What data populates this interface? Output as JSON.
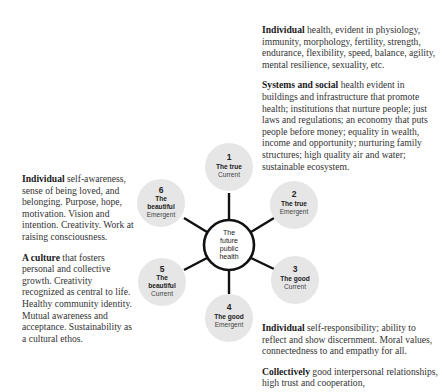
{
  "diagram": {
    "center": {
      "lines": [
        "The",
        "future",
        "public",
        "health"
      ]
    },
    "nodes": [
      {
        "number": "1",
        "title": [
          "The true"
        ],
        "subtitle": "Current"
      },
      {
        "number": "2",
        "title": [
          "The true"
        ],
        "subtitle": "Emergent"
      },
      {
        "number": "3",
        "title": [
          "The good"
        ],
        "subtitle": "Current"
      },
      {
        "number": "4",
        "title": [
          "The good"
        ],
        "subtitle": "Emergent"
      },
      {
        "number": "5",
        "title": [
          "The",
          "beautiful"
        ],
        "subtitle": "Current"
      },
      {
        "number": "6",
        "title": [
          "The",
          "beautiful"
        ],
        "subtitle": "Emergent"
      }
    ],
    "colors": {
      "node_fill": "#e6e6e6",
      "center_fill": "#ffffff",
      "stroke": "#111111"
    }
  },
  "text_blocks": {
    "top_right": [
      {
        "bold": "Individual",
        "text": " health, evident in physiology, immunity, morphology, fertility, strength, endurance, flexibility, speed, balance, agility, mental resilience, sexuality, etc."
      },
      {
        "bold": "Systems and social",
        "text": " health evident in buildings and infrastructure that promote health; institutions that nurture people; just laws and regulations; an economy that puts people before money; equality in wealth, income and opportunity; nurturing family structures; high quality air and water; sustainable ecosystem."
      }
    ],
    "left": [
      {
        "bold": "Individual",
        "text": " self-awareness, sense of being loved, and belonging. Purpose, hope, motivation. Vision and intention. Creativity. Work at raising consciousness."
      },
      {
        "bold": "A culture",
        "text": " that fosters personal and collective growth. Creativity recognized as central to life. Healthy community identity. Mutual awareness and acceptance. Sustainability as a cultural ethos."
      }
    ],
    "bottom_right": [
      {
        "bold": "Individual",
        "text": " self-responsibility; ability to reflect and show discernment. Moral values, connectedness to and empathy for all."
      },
      {
        "bold": "Collectively",
        "text": " good interpersonal relationships, high trust and cooperation,"
      }
    ]
  }
}
